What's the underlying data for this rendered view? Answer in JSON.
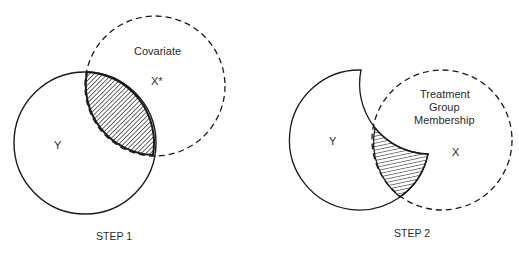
{
  "diagram": {
    "colors": {
      "stroke": "#1a1a1a",
      "background": "#ffffff",
      "text": "#2a2a2a"
    },
    "step1": {
      "caption": "STEP 1",
      "y_label": "Y",
      "covariate_label": "Covariate",
      "x_label": "X*",
      "y_circle": {
        "cx": 85,
        "cy": 143,
        "r": 71,
        "style": "solid"
      },
      "x_circle": {
        "cx": 155,
        "cy": 86,
        "r": 70,
        "style": "dashed"
      },
      "shaded": "overlap of Y and covariate X*"
    },
    "step2": {
      "caption": "STEP 2",
      "y_label": "Y",
      "treatment_label_lines": [
        "Treatment",
        "Group",
        "Membership"
      ],
      "x_label": "X",
      "y_circle": {
        "cx": 362,
        "cy": 140,
        "r": 70,
        "style": "solid, covariate portion removed"
      },
      "x_circle": {
        "cx": 442,
        "cy": 140,
        "r": 70,
        "style": "dashed"
      },
      "shaded": "overlap of residual Y and treatment X"
    }
  }
}
